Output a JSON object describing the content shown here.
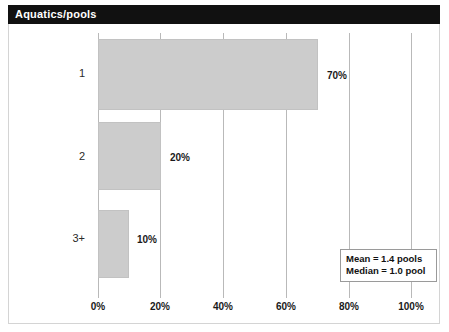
{
  "window": {
    "title": "Aquatics/pools"
  },
  "chart_data": {
    "type": "bar",
    "orientation": "horizontal",
    "title": "Aquatics/pools",
    "xlabel": "",
    "ylabel": "",
    "categories": [
      "1",
      "2",
      "3+"
    ],
    "values": [
      70,
      20,
      10
    ],
    "value_labels": [
      "70%",
      "20%",
      "10%"
    ],
    "xlim": [
      0,
      100
    ],
    "xticks": [
      0,
      20,
      40,
      60,
      80,
      100
    ],
    "xtick_labels": [
      "0%",
      "20%",
      "40%",
      "60%",
      "80%",
      "100%"
    ],
    "grid": "vertical",
    "legend": "none",
    "bar_color": "#cccccc",
    "bar_edge_color": "#c2c2c2",
    "gridline_color": "#b9b9b9",
    "annotations": [
      "Mean = 1.4 pools",
      "Median = 1.0 pool"
    ]
  },
  "stats": {
    "mean": "Mean = 1.4 pools",
    "median": "Median = 1.0 pool"
  }
}
